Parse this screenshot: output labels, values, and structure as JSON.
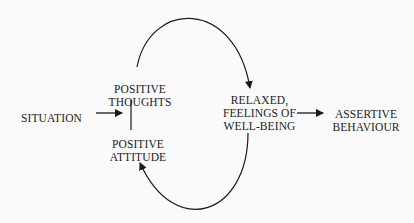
{
  "diagram": {
    "type": "flow-cycle",
    "nodes": {
      "situation": {
        "lines": [
          "SITUATION"
        ]
      },
      "positive_thoughts": {
        "lines": [
          "POSITIVE",
          "THOUGHTS"
        ]
      },
      "positive_attitude": {
        "lines": [
          "POSITIVE",
          "ATTITUDE"
        ]
      },
      "relaxed": {
        "lines": [
          "RELAXED,",
          "FEELINGS OF",
          "WELL-BEING"
        ]
      },
      "assertive": {
        "lines": [
          "ASSERTIVE",
          "BEHAVIOUR"
        ]
      }
    },
    "edges": [
      {
        "from": "situation",
        "to": "positive_thoughts/positive_attitude",
        "style": "straight-arrow"
      },
      {
        "from": "positive_thoughts",
        "to": "positive_attitude",
        "style": "line"
      },
      {
        "from": "positive_thoughts",
        "to": "relaxed",
        "style": "arc-over"
      },
      {
        "from": "relaxed",
        "to": "positive_attitude",
        "style": "arc-under"
      },
      {
        "from": "relaxed",
        "to": "assertive",
        "style": "straight-arrow"
      }
    ],
    "colors": {
      "ink": "#1a1a1a",
      "background": "#fafafa"
    }
  }
}
